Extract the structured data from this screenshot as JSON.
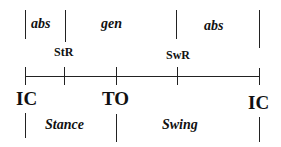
{
  "diagram": {
    "type": "gait-cycle-timeline",
    "colors": {
      "line": "#222222",
      "text": "#111111",
      "background": "#ffffff"
    },
    "power_phases": [
      {
        "label": "abs",
        "from": "IC",
        "to": "StR"
      },
      {
        "label": "gen",
        "from": "StR",
        "to": "SwR"
      },
      {
        "label": "abs",
        "from": "SwR",
        "to": "IC"
      }
    ],
    "reversal_markers": [
      {
        "label": "StR"
      },
      {
        "label": "SwR"
      }
    ],
    "events": [
      {
        "label": "IC"
      },
      {
        "label": "TO"
      },
      {
        "label": "IC"
      }
    ],
    "periods": [
      {
        "label": "Stance",
        "from": "IC",
        "to": "TO"
      },
      {
        "label": "Swing",
        "from": "TO",
        "to": "IC"
      }
    ]
  }
}
